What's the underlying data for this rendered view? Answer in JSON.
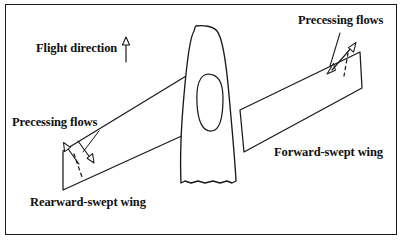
{
  "figure": {
    "border_color": "#1a1a1a",
    "line_color": "#1a1a1a",
    "background": "#ffffff"
  },
  "labels": {
    "flight_direction": "Flight direction",
    "precessing_flows_left": "Precessing flows",
    "precessing_flows_right": "Precessing flows",
    "rearward_swept_wing": "Rearward-swept wing",
    "forward_swept_wing": "Forward-swept wing"
  },
  "icons": {
    "flight_direction_arrow": "arrow-up-icon",
    "precessing_arrow_left_up": "arrow-up-left-icon",
    "precessing_arrow_left_down": "arrow-down-right-icon",
    "precessing_arrow_right_up": "arrow-up-right-icon",
    "precessing_arrow_right_down": "arrow-down-left-icon"
  },
  "diagram": {
    "fuselage": "rounded tapered body viewed from above, centered",
    "canopy": "oval cockpit canopy outline inside fuselage",
    "left_wing": "rearward-swept wing panel extending down-left from fuselage",
    "right_wing": "forward-swept wing panel extending up-right from fuselage",
    "dashed_left": "dashed flow line at rearward wing tip",
    "dashed_right": "dashed flow line at forward wing tip"
  }
}
